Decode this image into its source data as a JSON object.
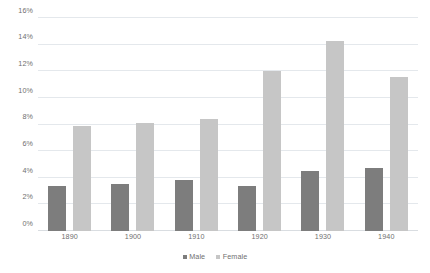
{
  "chart_data": {
    "type": "bar",
    "title": "",
    "subtitle": "",
    "xlabel": "",
    "ylabel": "",
    "categories": [
      "1890",
      "1900",
      "1910",
      "1920",
      "1930",
      "1940"
    ],
    "series": [
      {
        "name": "Male",
        "color": "#7d7d7d",
        "values": [
          3.4,
          3.5,
          3.8,
          3.4,
          4.5,
          4.7
        ]
      },
      {
        "name": "Female",
        "color": "#c6c6c6",
        "values": [
          7.9,
          8.1,
          8.4,
          12.0,
          14.3,
          11.6
        ]
      }
    ],
    "ylim": [
      0,
      16
    ],
    "ytick_values": [
      0,
      2,
      4,
      6,
      8,
      10,
      12,
      14,
      16
    ],
    "ytick_labels": [
      "0%",
      "2%",
      "4%",
      "6%",
      "8%",
      "10%",
      "12%",
      "14%",
      "16%"
    ],
    "grid": true,
    "grid_axis": "y",
    "legend_position": "bottom-center",
    "value_unit": "%",
    "background_color": "#ffffff",
    "gridline_color": "#e4e8ec",
    "tick_label_color": "#6f6f6f"
  }
}
